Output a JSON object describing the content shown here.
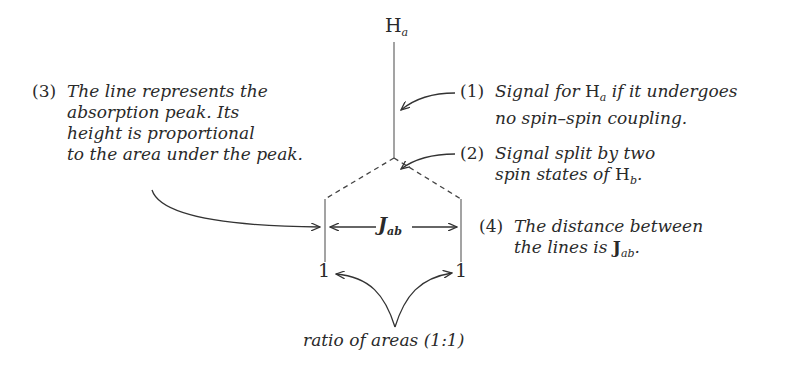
{
  "diagram": {
    "title_label": {
      "main": "H",
      "sub": "a"
    },
    "annotations": [
      {
        "number": "(1)",
        "lines": [
          "Signal for ",
          "H",
          "a",
          " if it undergoes",
          "no spin–spin coupling."
        ]
      },
      {
        "number": "(2)",
        "lines": [
          "Signal split by two",
          "spin states of ",
          "H",
          "b",
          "."
        ]
      },
      {
        "number": "(3)",
        "lines": [
          "The line represents the",
          "absorption peak. Its",
          "height is proportional",
          "to the area under the peak."
        ]
      },
      {
        "number": "(4)",
        "lines": [
          "The distance between",
          "the lines is ",
          "J",
          "ab",
          "."
        ]
      }
    ],
    "coupling_label": {
      "main": "J",
      "sub": "ab"
    },
    "peak_labels": [
      "1",
      "1"
    ],
    "ratio_caption": "ratio of areas (1:1)",
    "colors": {
      "line": "#555555",
      "text": "#2a2a2a"
    }
  }
}
